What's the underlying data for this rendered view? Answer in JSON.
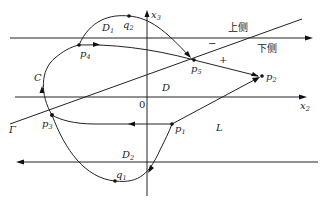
{
  "figure": {
    "axes": {
      "x2_label": "x",
      "x2_sub": "2",
      "x3_label": "x",
      "x3_sub": "3",
      "origin_label": "0"
    },
    "sides": {
      "upper": "上侧",
      "lower": "下侧",
      "minus": "−",
      "plus": "+"
    },
    "regions": {
      "D": "D",
      "D1": "D",
      "D1_sub": "1",
      "D2": "D",
      "D2_sub": "2"
    },
    "curves": {
      "gamma": "Γ",
      "L": "L",
      "C": "C"
    },
    "points": {
      "p1": {
        "label": "p",
        "sub": "1"
      },
      "p2": {
        "label": "p",
        "sub": "2"
      },
      "p3": {
        "label": "p",
        "sub": "3"
      },
      "p4": {
        "label": "p",
        "sub": "4"
      },
      "p5": {
        "label": "p",
        "sub": "5"
      },
      "q1": {
        "label": "q",
        "sub": "1"
      },
      "q2": {
        "label": "q",
        "sub": "2"
      }
    }
  }
}
